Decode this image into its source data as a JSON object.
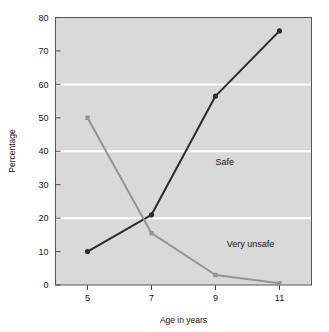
{
  "chart_data": {
    "type": "line",
    "title": "",
    "subtitle": "",
    "xlabel": "Age in years",
    "ylabel": "Percentage",
    "categories": [
      "5",
      "7",
      "9",
      "11"
    ],
    "x": [
      5,
      7,
      9,
      11
    ],
    "xlim": [
      4,
      12
    ],
    "ylim": [
      0,
      80
    ],
    "yticks": [
      "0",
      "10",
      "20",
      "30",
      "40",
      "50",
      "60",
      "70",
      "80"
    ],
    "ytick_values": [
      0,
      10,
      20,
      30,
      40,
      50,
      60,
      70,
      80
    ],
    "xticks": [
      "5",
      "7",
      "9",
      "11"
    ],
    "grid": "horizontal white gridlines at 20, 40, 60",
    "gridline_values": [
      20,
      40,
      60
    ],
    "legend_position": "inline annotations on plot",
    "plot_background": "#d9d9d9",
    "page_background": "#ffffff",
    "series": [
      {
        "name": "Safe",
        "color": "#2b2b2b",
        "marker": "circle",
        "values": [
          10,
          21,
          56.5,
          76
        ],
        "label_text": "Safe",
        "label_x": 9.0,
        "label_y": 36.0
      },
      {
        "name": "Very unsafe",
        "color": "#949494",
        "marker": "square",
        "values": [
          50,
          15.5,
          3,
          0.5
        ],
        "label_text": "Very unsafe",
        "label_x": 9.35,
        "label_y": 11.5
      }
    ],
    "annotations": [
      "Safe",
      "Very unsafe"
    ]
  },
  "axes": {
    "y_axis_title": "Percentage",
    "x_axis_title": "Age in years"
  }
}
